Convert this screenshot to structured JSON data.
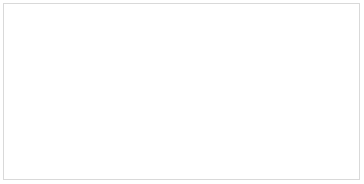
{
  "image": {
    "kind": "specimen-photograph",
    "subject": "dragonfly wings",
    "view": "dorsal, left pair, detached and mounted",
    "background_color": "#ffffff",
    "frame_color": "#d9d9d9",
    "vein_color": "#5a5f66",
    "membrane_color": "#fdfdfd",
    "pterostigma_color": "#3a3f45",
    "wing_base_color": "#1a1a1c",
    "caption": "",
    "specimen_label": "",
    "scale_bar_label": ""
  },
  "wings": [
    {
      "id": "forewing",
      "name": "Forewing (upper)",
      "orientation": "base at left, apex at right",
      "tip_x": 352,
      "base_x": 33,
      "pterostigma": {
        "present": true,
        "label": "pterostigma",
        "x": 288,
        "y": 12,
        "length": 30,
        "color": "#3a3f45"
      },
      "nodus": {
        "present": true,
        "x": 196,
        "y": 21
      },
      "base_spot": {
        "present": true,
        "color": "#141416",
        "x": 36,
        "y": 30
      }
    },
    {
      "id": "hindwing",
      "name": "Hindwing (lower)",
      "orientation": "base at left, apex at right",
      "tip_x": 330,
      "base_x": 36,
      "pterostigma": {
        "present": true,
        "label": "pterostigma",
        "x": 278,
        "y": 93,
        "length": 30,
        "color": "#3a3f45"
      },
      "nodus": {
        "present": true,
        "x": 176,
        "y": 96
      },
      "base_spot": {
        "present": true,
        "color": "#141416",
        "x": 40,
        "y": 82
      },
      "anal_loop": {
        "present": true,
        "label": "anal loop"
      }
    }
  ],
  "annotations": {
    "title": "",
    "subtitle": "",
    "credit": ""
  }
}
